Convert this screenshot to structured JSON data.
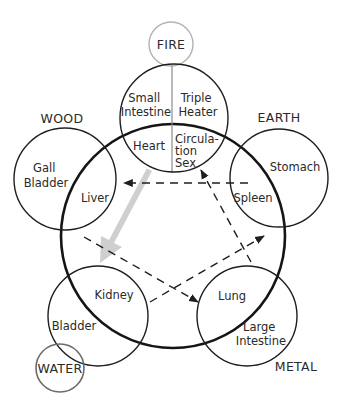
{
  "colors": {
    "ink": "#1e1e1e",
    "fire_ring": "#b3b3b3",
    "water_ring": "#6a6a6a",
    "sheng_arrow": "#cfcfcf"
  },
  "elements": {
    "fire": {
      "name": "FIRE",
      "organs": {
        "outer_left": [
          "Small",
          "Intestine"
        ],
        "outer_right": [
          "Triple",
          "Heater"
        ],
        "inner_left": [
          "Heart"
        ],
        "inner_right": [
          "Circula-",
          "tion",
          "Sex"
        ]
      }
    },
    "wood": {
      "name": "WOOD",
      "organs": {
        "outer": [
          "Gall",
          "Bladder"
        ],
        "inner": [
          "Liver"
        ]
      }
    },
    "earth": {
      "name": "EARTH",
      "organs": {
        "outer": [
          "Stomach"
        ],
        "inner": [
          "Spleen"
        ]
      }
    },
    "metal": {
      "name": "METAL",
      "organs": {
        "outer": [
          "Large",
          "Intestine"
        ],
        "inner": [
          "Lung"
        ]
      }
    },
    "water": {
      "name": "WATER",
      "organs": {
        "outer": [
          "Bladder"
        ],
        "inner": [
          "Kidney"
        ]
      }
    }
  },
  "arrows": {
    "sheng_gray": "Fire (Heart) to Water (Kidney) — broad gray arrow",
    "ko_dashed": [
      "Earth (Spleen) → Wood (Liver)",
      "Wood (Liver) → Metal (Lung)",
      "Water (Kidney) → Earth (Spleen)",
      "Metal (Lung) → Fire (Circulation-Sex)"
    ]
  }
}
